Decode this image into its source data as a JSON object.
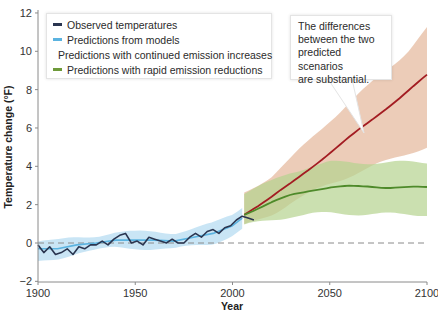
{
  "chart_data": {
    "type": "line",
    "title": "",
    "xlabel": "Year",
    "ylabel": "Temperature change (°F)",
    "xlim": [
      1900,
      2100
    ],
    "ylim": [
      -2,
      12
    ],
    "x_ticks": [
      1900,
      1950,
      2000,
      2050,
      2100
    ],
    "y_ticks": [
      -2,
      0,
      2,
      4,
      6,
      8,
      10,
      12
    ],
    "grid": false,
    "baseline": {
      "y": 0,
      "style": "dashed"
    },
    "legend_position": "upper left",
    "series": [
      {
        "name": "Observed temperatures",
        "color": "#2a3550",
        "x": [
          1900,
          1903,
          1906,
          1909,
          1912,
          1915,
          1918,
          1921,
          1924,
          1927,
          1930,
          1933,
          1936,
          1939,
          1942,
          1945,
          1948,
          1951,
          1954,
          1957,
          1960,
          1963,
          1966,
          1969,
          1972,
          1975,
          1978,
          1981,
          1984,
          1987,
          1990,
          1993,
          1996,
          1999,
          2002,
          2005,
          2008,
          2011
        ],
        "values": [
          -0.1,
          -0.5,
          -0.2,
          -0.6,
          -0.5,
          -0.3,
          -0.6,
          -0.2,
          -0.3,
          -0.1,
          -0.1,
          0.1,
          -0.1,
          0.2,
          0.4,
          0.5,
          0.0,
          0.1,
          -0.1,
          0.3,
          0.2,
          0.1,
          0.0,
          0.2,
          0.0,
          0.0,
          0.3,
          0.5,
          0.3,
          0.6,
          0.7,
          0.5,
          0.8,
          0.9,
          1.2,
          1.4,
          1.3,
          1.2
        ]
      },
      {
        "name": "Predictions from models",
        "color": "#5bb3e0",
        "x": [
          1900,
          1910,
          1920,
          1930,
          1940,
          1950,
          1960,
          1970,
          1980,
          1990,
          2000,
          2005
        ],
        "values": [
          -0.3,
          -0.3,
          -0.1,
          0.0,
          0.15,
          0.15,
          0.15,
          0.1,
          0.3,
          0.5,
          0.9,
          1.3
        ],
        "band_upper": [
          0.1,
          0.1,
          0.3,
          0.4,
          0.55,
          0.55,
          0.6,
          0.55,
          0.75,
          1.0,
          1.5,
          1.9
        ],
        "band_lower": [
          -1.0,
          -0.8,
          -0.5,
          -0.4,
          -0.25,
          -0.25,
          -0.3,
          -0.35,
          -0.15,
          0.0,
          0.4,
          0.7
        ]
      },
      {
        "name": "Predictions with continued emission increases",
        "color": "#a31c22",
        "x": [
          2006,
          2020,
          2030,
          2040,
          2050,
          2060,
          2070,
          2080,
          2090,
          2100
        ],
        "values": [
          1.5,
          2.4,
          3.1,
          3.9,
          4.7,
          5.5,
          6.3,
          7.1,
          7.9,
          8.75
        ],
        "band_upper": [
          2.6,
          3.5,
          4.4,
          5.4,
          6.4,
          7.3,
          8.2,
          9.1,
          10.0,
          11.2
        ],
        "band_lower": [
          0.9,
          1.5,
          2.1,
          2.6,
          3.1,
          3.5,
          3.9,
          4.3,
          4.7,
          5.0
        ]
      },
      {
        "name": "Predictions with rapid emission reductions",
        "color": "#4e8a2a",
        "x": [
          2006,
          2020,
          2030,
          2040,
          2050,
          2060,
          2070,
          2080,
          2090,
          2100
        ],
        "values": [
          1.5,
          2.1,
          2.5,
          2.75,
          2.9,
          2.95,
          2.95,
          2.9,
          2.9,
          2.9
        ],
        "band_upper": [
          2.6,
          3.2,
          3.7,
          4.0,
          4.2,
          4.2,
          4.2,
          4.2,
          4.2,
          4.2
        ],
        "band_lower": [
          0.9,
          1.2,
          1.4,
          1.5,
          1.55,
          1.55,
          1.5,
          1.5,
          1.5,
          1.5
        ]
      }
    ],
    "annotations": [
      {
        "text": "The differences between the two predicted scenarios are substantial.",
        "points_to": {
          "x": 2067,
          "y": 5.7
        }
      }
    ]
  },
  "axes": {
    "x_title": "Year",
    "y_title": "Temperature change (°F)",
    "x_tick_labels": [
      "1900",
      "1950",
      "2000",
      "2050",
      "2100"
    ],
    "y_tick_labels": [
      "−2",
      "0",
      "2",
      "4",
      "6",
      "8",
      "10",
      "12"
    ]
  },
  "legend": {
    "items": [
      {
        "label": "Observed temperatures",
        "color": "#2a3550"
      },
      {
        "label": "Predictions from models",
        "color": "#5bb3e0"
      },
      {
        "label": "Predictions with continued emission increases",
        "color": "#a31c22"
      },
      {
        "label": "Predictions with rapid emission reductions",
        "color": "#6e9a3a"
      }
    ]
  },
  "callout": {
    "lines": [
      "The differences",
      "between the two",
      "predicted scenarios",
      "are substantial."
    ]
  }
}
